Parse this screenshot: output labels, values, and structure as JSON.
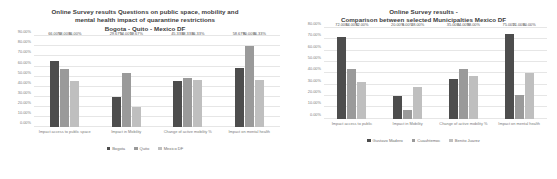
{
  "charts": [
    {
      "id": "left",
      "title_lines": [
        "Online Survey results Questions on public space, mobility and",
        "mental health impact of quarantine restrictions",
        "Bogota - Quito - Mexico DF"
      ],
      "chart_data": {
        "type": "bar",
        "title": "Online Survey results Questions on public space, mobility and mental health impact of quarantine restrictions Bogota - Quito - Mexico DF",
        "xlabel": "",
        "ylabel": "",
        "ylim": [
          0,
          90
        ],
        "ytick_labels": [
          "0.00%",
          "10.00%",
          "20.00%",
          "30.00%",
          "40.00%",
          "50.00%",
          "60.00%",
          "70.00%",
          "80.00%",
          "90.00%"
        ],
        "ytick_values": [
          0,
          10,
          20,
          30,
          40,
          50,
          60,
          70,
          80,
          90
        ],
        "grid": true,
        "legend_position": "bottom",
        "categories": [
          "Impact access to public space",
          "Impact in Mobility",
          "Change of active mobility %",
          "Impact on mental health"
        ],
        "series": [
          {
            "name": "Bogota",
            "color": "#4d4d4d",
            "values": [
              66.0,
              29.67,
              45.33,
              58.67
            ],
            "labels": [
              "66.00%",
              "29.67%",
              "45.33%",
              "58.67%"
            ]
          },
          {
            "name": "Quito",
            "color": "#9a9a9a",
            "values": [
              58.0,
              54.0,
              48.33,
              80.0
            ],
            "labels": [
              "58.00%",
              "54.00%",
              "48.33%",
              "80.00%"
            ]
          },
          {
            "name": "Mexico DF",
            "color": "#bfbfbf",
            "values": [
              46.0,
              19.67,
              46.33,
              46.33
            ],
            "labels": [
              "46.00%",
              "19.67%",
              "46.33%",
              "46.33%"
            ]
          }
        ]
      }
    },
    {
      "id": "right",
      "title_lines": [
        "Online Survey results -",
        "Comparison between selected Municipalties Mexico DF"
      ],
      "chart_data": {
        "type": "bar",
        "title": "Online Survey results - Comparison between selected Municipalties Mexico DF",
        "xlabel": "",
        "ylabel": "",
        "ylim": [
          0,
          80
        ],
        "ytick_labels": [
          "0.00%",
          "10.00%",
          "20.00%",
          "30.00%",
          "40.00%",
          "50.00%",
          "60.00%",
          "70.00%",
          "80.00%"
        ],
        "ytick_values": [
          0,
          10,
          20,
          30,
          40,
          50,
          60,
          70,
          80
        ],
        "grid": true,
        "legend_position": "bottom",
        "categories": [
          "Impact access to public",
          "Impact in Mobility",
          "Change of active mobility %",
          "Impact on mental health"
        ],
        "series": [
          {
            "name": "Gustavo Madero",
            "color": "#4d4d4d",
            "values": [
              72.0,
              20.0,
              35.0,
              75.0
            ],
            "labels": [
              "72.00%",
              "20.00%",
              "35.00%",
              "75.00%"
            ]
          },
          {
            "name": "Cuauhtemoc",
            "color": "#9a9a9a",
            "values": [
              44.0,
              8.0,
              44.0,
              21.0
            ],
            "labels": [
              "44.00%",
              "8.00%",
              "44.00%",
              "21.00%"
            ]
          },
          {
            "name": "Benito Juarez",
            "color": "#bfbfbf",
            "values": [
              32.0,
              28.0,
              38.0,
              40.0
            ],
            "labels": [
              "32.00%",
              "28.00%",
              "38.00%",
              "40.00%"
            ]
          }
        ]
      }
    }
  ]
}
